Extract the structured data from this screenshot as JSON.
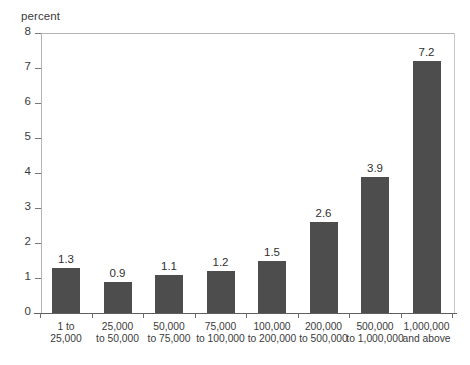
{
  "chart_data": {
    "type": "bar",
    "title": "",
    "subtitle": "",
    "xlabel": "",
    "ylabel": "percent",
    "ylim": [
      0,
      8
    ],
    "yticks": [
      0,
      1,
      2,
      3,
      4,
      5,
      6,
      7,
      8
    ],
    "grid": false,
    "legend": null,
    "bar_color": "#4d4d4d",
    "value_labels": true,
    "categories": [
      "1 to 25,000",
      "25,000 to 50,000",
      "50,000 to 75,000",
      "75,000 to 100,000",
      "100,000 to 200,000",
      "200,000 to 500,000",
      "500,000 to 1,000,000",
      "1,000,000 and above"
    ],
    "category_lines": [
      [
        "1 to",
        "25,000"
      ],
      [
        "25,000",
        "to 50,000"
      ],
      [
        "50,000",
        "to 75,000"
      ],
      [
        "75,000",
        "to 100,000"
      ],
      [
        "100,000",
        "to 200,000"
      ],
      [
        "200,000",
        "to 500,000"
      ],
      [
        "500,000",
        "to 1,000,000"
      ],
      [
        "1,000,000",
        "and above"
      ]
    ],
    "values": [
      1.3,
      0.9,
      1.1,
      1.2,
      1.5,
      2.6,
      3.9,
      7.2
    ],
    "value_strings": [
      "1.3",
      "0.9",
      "1.1",
      "1.2",
      "1.5",
      "2.6",
      "3.9",
      "7.2"
    ]
  },
  "axes": {
    "y_unit_label": "percent",
    "y_tick_labels": [
      "8",
      "7",
      "6",
      "5",
      "4",
      "3",
      "2",
      "1",
      "0"
    ]
  },
  "footer": {
    "clipped_caption": ""
  }
}
